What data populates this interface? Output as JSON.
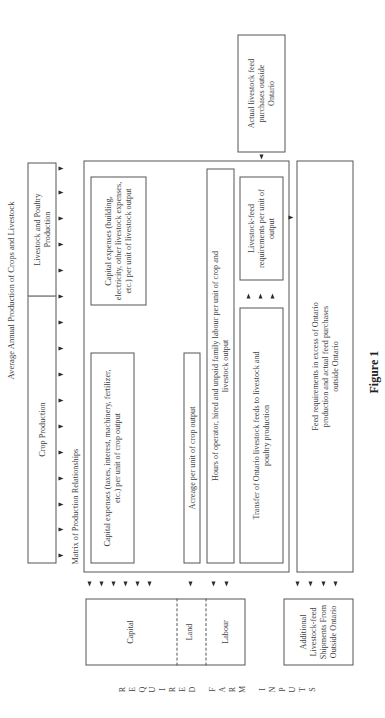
{
  "title": "Average Annual Production of Crops and Livestock",
  "header_boxes": {
    "crop": "Crop Production",
    "livestock": "Livestock and Poultry Production"
  },
  "matrix_label": "Matrix of Production Relationships",
  "matrix_cells": {
    "capital_crop": "Capital expenses (taxes, interest, machinery, fertilizer, etc.) per unit of crop output",
    "capital_livestock": "Capital expenses (building, electricity, other livestock expenses, etc.) per unit of livestock output",
    "acreage": "Acreage per unit of crop output",
    "labour": "Hours of operator, hired and unpaid family labour per unit of crop and livestock output",
    "transfer": "Transfer of Ontario livestock feeds to livestock and poultry production",
    "feed_req": "Livestock-feed requirements per unit of output"
  },
  "side_boxes": {
    "actual_purchases": "Actual livestock feed purchases outside Ontario",
    "excess": "Feed requirements in excess of Ontario production and actual feed purchases outside Ontario"
  },
  "input_boxes": {
    "capital": "Capital",
    "land": "Land",
    "labour": "Labour",
    "additional": "Additional Livestock-feed Shipments From Outside Ontario"
  },
  "vertical_label_letters": [
    "R",
    "E",
    "Q",
    "U",
    "I",
    "R",
    "E",
    "D",
    "",
    "F",
    "A",
    "R",
    "M",
    "",
    "I",
    "N",
    "P",
    "U",
    "T",
    "S"
  ],
  "vertical_label": "REQUIRED FARM INPUTS",
  "caption": "Figure 1"
}
